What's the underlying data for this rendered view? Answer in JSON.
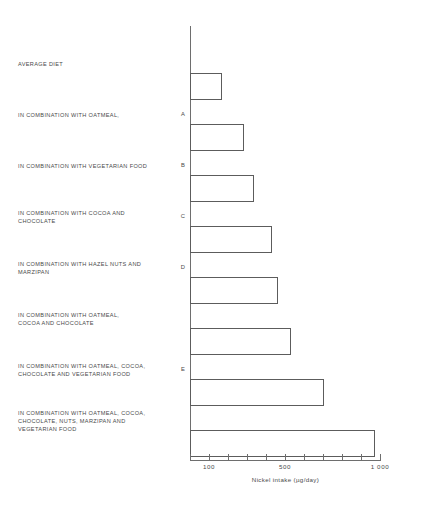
{
  "chart_data": {
    "type": "bar",
    "orientation": "horizontal",
    "title": "",
    "xlabel": "Nickel intake (µg/day)",
    "ylabel": "",
    "xscale": "log",
    "grid": false,
    "legend": null,
    "xlim": [
      80,
      1000
    ],
    "xtick_labels": [
      "100",
      "500",
      "1 000"
    ],
    "xtick_values": [
      100,
      500,
      1000
    ],
    "categories": [
      "AVERAGE DIET",
      "IN COMBINATION WITH OATMEAL,",
      "IN COMBINATION WITH VEGETARIAN FOOD",
      "IN COMBINATION WITH COCOA AND\nCHOCOLATE",
      "IN COMBINATION WITH HAZEL NUTS AND\nMARZIPAN",
      "IN COMBINATION WITH OATMEAL,\nCOCOA AND CHOCOLATE",
      "IN COMBINATION WITH OATMEAL, COCOA,\nCHOCOLATE AND VEGETARIAN FOOD",
      "IN COMBINATION WITH OATMEAL, COCOA,\nCHOCOLATE, NUTS, MARZIPAN AND\nVEGETARIAN FOOD"
    ],
    "keys": [
      "",
      "A",
      "B",
      "C",
      "D",
      "",
      "E",
      ""
    ],
    "values": [
      160,
      280,
      330,
      430,
      470,
      600,
      800,
      1000
    ],
    "bar_facecolor": "#ffffff",
    "bar_edgecolor": "#5c5c5c",
    "axis_color": "#6e6e6e",
    "text_color": "#4a4a4a"
  },
  "axis": {
    "ticks_px": [
      190,
      209,
      228,
      247,
      266,
      285,
      304,
      323,
      342,
      361,
      380
    ],
    "labels": [
      {
        "text": "100",
        "x": 209
      },
      {
        "text": "500",
        "x": 285
      },
      {
        "text": "1 000",
        "x": 380
      }
    ]
  },
  "bars_px": [
    {
      "top": 47,
      "width": 32
    },
    {
      "top": 98,
      "width": 54
    },
    {
      "top": 149,
      "width": 64
    },
    {
      "top": 200,
      "width": 82
    },
    {
      "top": 251,
      "width": 88
    },
    {
      "top": 302,
      "width": 101
    },
    {
      "top": 353,
      "width": 134
    },
    {
      "top": 404,
      "width": 185
    }
  ],
  "labels_px": [
    {
      "top": 60,
      "key_top": 60
    },
    {
      "top": 111,
      "key_top": 111
    },
    {
      "top": 162,
      "key_top": 162
    },
    {
      "top": 209,
      "key_top": 213
    },
    {
      "top": 260,
      "key_top": 264
    },
    {
      "top": 311,
      "key_top": 315
    },
    {
      "top": 362,
      "key_top": 366
    },
    {
      "top": 409,
      "key_top": 417
    }
  ]
}
